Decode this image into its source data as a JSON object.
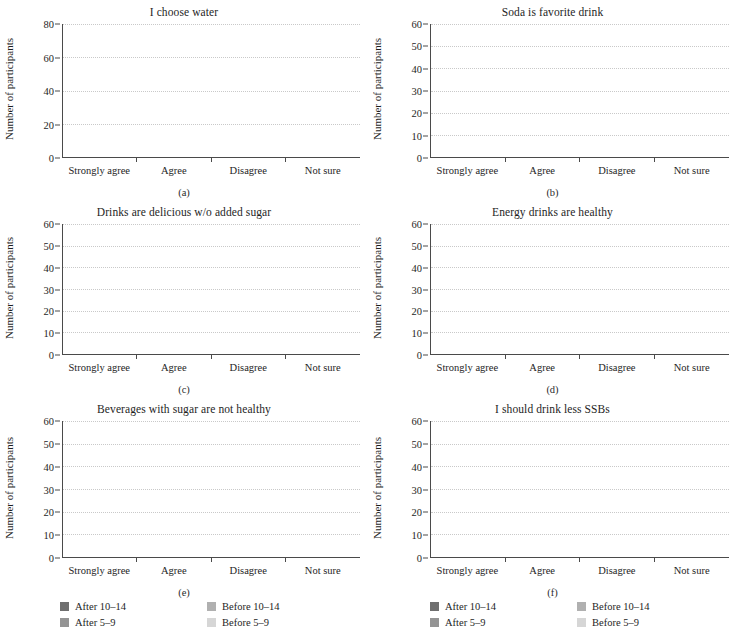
{
  "figure": {
    "xlabel_categories": [
      "Strongly agree",
      "Agree",
      "Disagree",
      "Not sure"
    ],
    "ylabel": "Number of participants",
    "legend": [
      {
        "label": "After 10–14",
        "color": "#6f6f6f",
        "key": "after_10_14"
      },
      {
        "label": "Before 10–14",
        "color": "#b0b0b0",
        "key": "before_10_14"
      },
      {
        "label": "After 5–9",
        "color": "#949494",
        "key": "after_5_9"
      },
      {
        "label": "Before 5–9",
        "color": "#d6d6d6",
        "key": "before_5_9"
      }
    ],
    "colors": {
      "after_10_14": "#6f6f6f",
      "after_5_9": "#949494",
      "before_10_14": "#b0b0b0",
      "before_5_9": "#d6d6d6",
      "axis": "#4a4a4a",
      "gridline": "#c9c9c9",
      "text": "#1e1e1e"
    }
  },
  "chart_data": [
    {
      "id": "a",
      "sublabel": "(a)",
      "type": "bar",
      "title": "I choose water",
      "xlabel": "",
      "ylabel": "Number of participants",
      "ylim": [
        0,
        80
      ],
      "yticks": [
        0,
        20,
        40,
        60,
        80
      ],
      "grid": true,
      "legend_position": "figure-bottom",
      "categories": [
        "Strongly agree",
        "Agree",
        "Disagree",
        "Not sure"
      ],
      "series": [
        {
          "name": "Before 5–9",
          "values": [
            37,
            23,
            11,
            10
          ]
        },
        {
          "name": "Before 10–14",
          "values": [
            20,
            27,
            0,
            0
          ]
        },
        {
          "name": "After 5–9",
          "values": [
            35,
            26,
            3,
            8
          ]
        },
        {
          "name": "After 10–14",
          "values": [
            25,
            29,
            0,
            3
          ]
        }
      ],
      "totals": {
        "before": [
          57,
          50,
          11,
          10
        ],
        "after": [
          60,
          55,
          3,
          11
        ]
      }
    },
    {
      "id": "b",
      "sublabel": "(b)",
      "type": "bar",
      "title": "Soda is favorite drink",
      "xlabel": "",
      "ylabel": "Number of participants",
      "ylim": [
        0,
        60
      ],
      "yticks": [
        0,
        10,
        20,
        30,
        40,
        50,
        60
      ],
      "grid": true,
      "legend_position": "figure-bottom",
      "categories": [
        "Strongly agree",
        "Agree",
        "Disagree",
        "Not sure"
      ],
      "series": [
        {
          "name": "Before 5–9",
          "values": [
            18,
            19,
            25,
            10
          ]
        },
        {
          "name": "Before 10–14",
          "values": [
            16,
            12,
            23,
            5
          ]
        },
        {
          "name": "After 5–9",
          "values": [
            15,
            19,
            25,
            12
          ]
        },
        {
          "name": "After 10–14",
          "values": [
            10,
            15,
            27,
            6
          ]
        }
      ],
      "totals": {
        "before": [
          34,
          31,
          48,
          15
        ],
        "after": [
          25,
          34,
          52,
          18
        ]
      }
    },
    {
      "id": "c",
      "sublabel": "(c)",
      "type": "bar",
      "title": "Drinks are delicious w/o added sugar",
      "xlabel": "",
      "ylabel": "Number of participants",
      "ylim": [
        0,
        60
      ],
      "yticks": [
        0,
        10,
        20,
        30,
        40,
        50,
        60
      ],
      "grid": true,
      "legend_position": "figure-bottom",
      "categories": [
        "Strongly agree",
        "Agree",
        "Disagree",
        "Not sure"
      ],
      "series": [
        {
          "name": "Before 5–9",
          "values": [
            8,
            8,
            37,
            16
          ]
        },
        {
          "name": "Before 10–14",
          "values": [
            20,
            20,
            12,
            7
          ]
        },
        {
          "name": "After 5–9",
          "values": [
            11,
            11,
            35,
            14
          ]
        },
        {
          "name": "After 10–14",
          "values": [
            26,
            19,
            8,
            4
          ]
        }
      ],
      "totals": {
        "before": [
          28,
          28,
          49,
          23
        ],
        "after": [
          37,
          30,
          43,
          18
        ]
      }
    },
    {
      "id": "d",
      "sublabel": "(d)",
      "type": "bar",
      "title": "Energy drinks are healthy",
      "xlabel": "",
      "ylabel": "Number of participants",
      "ylim": [
        0,
        60
      ],
      "yticks": [
        0,
        10,
        20,
        30,
        40,
        50,
        60
      ],
      "grid": true,
      "legend_position": "figure-bottom",
      "categories": [
        "Strongly agree",
        "Agree",
        "Disagree",
        "Not sure"
      ],
      "series": [
        {
          "name": "Before 5–9",
          "values": [
            19,
            30,
            12,
            13
          ]
        },
        {
          "name": "Before 10–14",
          "values": [
            1,
            6,
            37,
            10
          ]
        },
        {
          "name": "After 5–9",
          "values": [
            29,
            27,
            9,
            10
          ]
        },
        {
          "name": "After 10–14",
          "values": [
            3,
            4,
            37,
            9
          ]
        }
      ],
      "totals": {
        "before": [
          20,
          36,
          49,
          23
        ],
        "after": [
          32,
          31,
          46,
          19
        ]
      }
    },
    {
      "id": "e",
      "sublabel": "(e)",
      "type": "bar",
      "title": "Beverages with sugar are not healthy",
      "xlabel": "",
      "ylabel": "Number of participants",
      "ylim": [
        0,
        60
      ],
      "yticks": [
        0,
        10,
        20,
        30,
        40,
        50,
        60
      ],
      "grid": true,
      "legend_position": "panel",
      "categories": [
        "Strongly agree",
        "Agree",
        "Disagree",
        "Not sure"
      ],
      "series": [
        {
          "name": "Before 5–9",
          "values": [
            23,
            20,
            21,
            9
          ]
        },
        {
          "name": "Before 10–14",
          "values": [
            23,
            19,
            13,
            0
          ]
        },
        {
          "name": "After 5–9",
          "values": [
            16,
            24,
            21,
            10
          ]
        },
        {
          "name": "After 10–14",
          "values": [
            25,
            25,
            7,
            0
          ]
        }
      ],
      "totals": {
        "before": [
          46,
          39,
          34,
          9
        ],
        "after": [
          41,
          49,
          28,
          10
        ]
      }
    },
    {
      "id": "f",
      "sublabel": "(f)",
      "type": "bar",
      "title": "I should drink less SSBs",
      "xlabel": "",
      "ylabel": "Number of participants",
      "ylim": [
        0,
        60
      ],
      "yticks": [
        0,
        10,
        20,
        30,
        40,
        50,
        60
      ],
      "grid": true,
      "legend_position": "panel",
      "categories": [
        "Strongly agree",
        "Agree",
        "Disagree",
        "Not sure"
      ],
      "series": [
        {
          "name": "Before 5–9",
          "values": [
            32,
            26,
            4,
            7
          ]
        },
        {
          "name": "Before 10–14",
          "values": [
            16,
            23,
            16,
            5
          ]
        },
        {
          "name": "After 5–9",
          "values": [
            27,
            27,
            10,
            11
          ]
        },
        {
          "name": "After 10–14",
          "values": [
            12,
            27,
            7,
            7
          ]
        }
      ],
      "totals": {
        "before": [
          48,
          49,
          20,
          12
        ],
        "after": [
          39,
          54,
          17,
          18
        ]
      }
    }
  ]
}
